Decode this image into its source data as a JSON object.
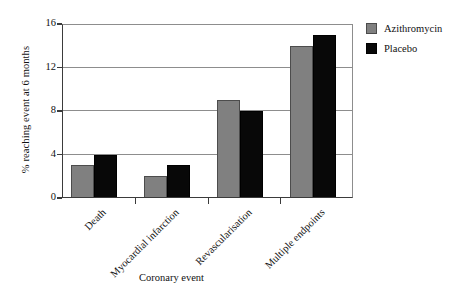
{
  "chart_data": {
    "type": "bar",
    "title": "",
    "subtitle": "",
    "xlabel": "Coronary event",
    "ylabel": "% reaching event at 6 months",
    "categories": [
      "Death",
      "Myocardial infarction",
      "Revascularisation",
      "Multiple endpoints"
    ],
    "series": [
      {
        "name": "Azithromycin",
        "color": "#808080",
        "values": [
          3,
          2,
          9,
          14
        ]
      },
      {
        "name": "Placebo",
        "color": "#080808",
        "values": [
          4,
          3,
          8,
          15
        ]
      }
    ],
    "ylim": [
      0,
      16
    ],
    "yticks": [
      0,
      4,
      8,
      12,
      16
    ],
    "ytick_labels": [
      "0",
      "4",
      "8",
      "12",
      "16"
    ],
    "grid": "horizontal",
    "legend_position": "right-top",
    "annotations": []
  },
  "legend": {
    "entries": [
      {
        "label": "Azithromycin",
        "swatch": "gray-swatch-icon"
      },
      {
        "label": "Placebo",
        "swatch": "black-swatch-icon"
      }
    ]
  },
  "axes": {
    "x_title": "Coronary event",
    "y_title": "% reaching event at 6 months"
  }
}
